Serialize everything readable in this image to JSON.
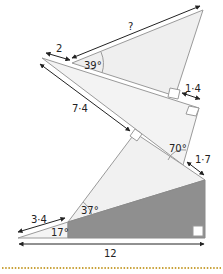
{
  "diagram": {
    "colors": {
      "light_fill": "#eeeeee",
      "dark_fill": "#8f8f8f",
      "stroke": "#9a9a9a",
      "arrow": "#222222",
      "dots": "#c9a23a"
    },
    "labels": {
      "top_hyp": "?",
      "top_left_seg": "2",
      "angle_top": "39°",
      "right_seg_top": "1·4",
      "mid_hyp": "7·4",
      "angle_mid": "70°",
      "right_seg_mid": "1·7",
      "angle_lower": "37°",
      "bottom_seg": "3·4",
      "angle_bottom": "17°",
      "base": "12"
    }
  }
}
